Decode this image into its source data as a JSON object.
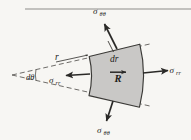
{
  "figure": {
    "kind": "stress-element-polar-coordinates",
    "background_color": "#f7f6f3",
    "ink_color": "#1d1c1a",
    "element_fill_color": "#c9c8c6",
    "element_stroke_color": "#3a3936",
    "rule_color": "#8d8c89",
    "labels": {
      "sigma_symbol": "σ",
      "hoop_subscript": "θθ",
      "radial_subscript": "rr",
      "stress_hoop_top": "σ",
      "stress_hoop_top_sub": "θθ",
      "stress_hoop_bottom": "σ",
      "stress_hoop_bottom_sub": "θθ",
      "stress_radial_right": "σ",
      "stress_radial_right_sub": "rr",
      "stress_radial_left": "σ",
      "stress_radial_left_sub": "rr",
      "radius": "r",
      "radial_thickness": "dr",
      "position_vector": "R",
      "angle_increment": "dθ"
    },
    "geometry": {
      "apex_x": 12,
      "apex_y": 75,
      "wedge_half_angle_deg": 12,
      "inner_radius": 78,
      "outer_radius": 128,
      "rule_y": 9,
      "rule_x_start": 25,
      "rule_x_end": 191
    }
  }
}
